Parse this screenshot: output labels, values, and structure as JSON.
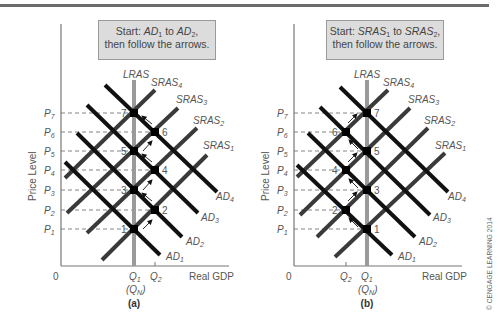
{
  "panels": [
    {
      "id": "a",
      "caption": "(a)",
      "callout": {
        "prefix": "Start: ",
        "from": "AD",
        "from_sub": "1",
        "mid": " to ",
        "to": "AD",
        "to_sub": "2",
        "suffix": ",",
        "line2": "then follow the arrows."
      },
      "ylabel": "Price Level",
      "xlabel": "Real GDP",
      "origin": "0",
      "x_ticks": [
        {
          "label": "Q",
          "sub": "1",
          "note": "(Q",
          "note_sub": "N",
          "note_end": ")"
        },
        {
          "label": "Q",
          "sub": "2"
        }
      ],
      "y_ticks": [
        "P7",
        "P6",
        "P5",
        "P4",
        "P3",
        "P2",
        "P1"
      ],
      "curves": {
        "lras": "LRAS",
        "sras": [
          "SRAS1",
          "SRAS2",
          "SRAS3",
          "SRAS4"
        ],
        "ad": [
          "AD1",
          "AD2",
          "AD3",
          "AD4"
        ]
      },
      "points": [
        "1",
        "2",
        "3",
        "4",
        "5",
        "6",
        "7"
      ]
    },
    {
      "id": "b",
      "caption": "(b)",
      "callout": {
        "prefix": "Start: ",
        "from": "SRAS",
        "from_sub": "1",
        "mid": " to ",
        "to": "SRAS",
        "to_sub": "2",
        "suffix": ",",
        "line2": "then follow the arrows."
      },
      "ylabel": "Price Level",
      "xlabel": "Real GDP",
      "origin": "0",
      "x_ticks": [
        {
          "label": "Q",
          "sub": "2"
        },
        {
          "label": "Q",
          "sub": "1",
          "note": "(Q",
          "note_sub": "N",
          "note_end": ")"
        }
      ],
      "y_ticks": [
        "P7",
        "P6",
        "P5",
        "P4",
        "P3",
        "P2",
        "P1"
      ],
      "curves": {
        "lras": "LRAS",
        "sras": [
          "SRAS1",
          "SRAS2",
          "SRAS3",
          "SRAS4"
        ],
        "ad": [
          "AD1",
          "AD2",
          "AD3",
          "AD4"
        ]
      },
      "points": [
        "1",
        "2",
        "3",
        "4",
        "5",
        "6",
        "7"
      ]
    }
  ],
  "copyright": "© CENGAGE LEARNING 2014",
  "colors": {
    "ad": "#111111",
    "sras": "#3a3a3a",
    "lras": "#9a9a9a",
    "callout_fill": "#dcdcdc",
    "text": "#555555"
  }
}
